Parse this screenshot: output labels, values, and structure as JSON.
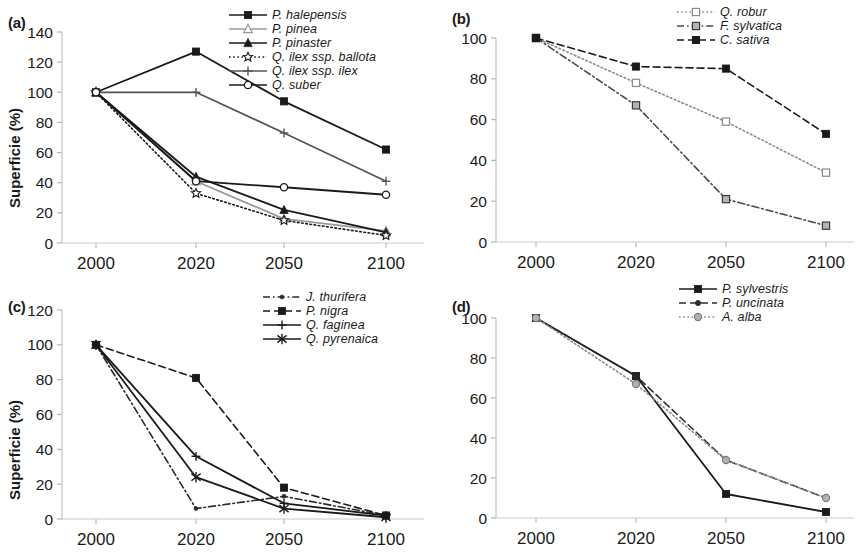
{
  "figure": {
    "x_categories": [
      "2000",
      "2020",
      "2050",
      "2100"
    ],
    "y_axis_title": "Superficie (%)"
  },
  "panels": {
    "a": {
      "label": "(a)",
      "y_ticks": [
        "0",
        "20",
        "40",
        "60",
        "80",
        "100",
        "120",
        "140"
      ],
      "y_title": "Superficie (%)"
    },
    "b": {
      "label": "(b)",
      "y_ticks": [
        "0",
        "20",
        "40",
        "60",
        "80",
        "100"
      ],
      "y_title": ""
    },
    "c": {
      "label": "(c)",
      "y_ticks": [
        "0",
        "20",
        "40",
        "60",
        "80",
        "100",
        "120"
      ],
      "y_title": "Superficie (%)"
    },
    "d": {
      "label": "(d)",
      "y_ticks": [
        "0",
        "20",
        "40",
        "60",
        "80",
        "100"
      ],
      "y_title": ""
    }
  },
  "legend_labels": {
    "a": [
      "P. halepensis",
      "P. pinea",
      "P. pinaster",
      "Q. ilex ssp. ballota",
      "Q. ilex ssp. ilex",
      "Q. suber"
    ],
    "b": [
      "Q. robur",
      "F. sylvatica",
      "C. sativa"
    ],
    "c": [
      "J. thurifera",
      "P. nigra",
      "Q. faginea",
      "Q. pyrenaica"
    ],
    "d": [
      "P. sylvestris",
      "P. uncinata",
      "A. alba"
    ]
  },
  "chart_data": [
    {
      "type": "line",
      "panel": "a",
      "title": "(a)",
      "xlabel": "",
      "ylabel": "Superficie (%)",
      "x": [
        "2000",
        "2020",
        "2050",
        "2100"
      ],
      "ylim": [
        0,
        140
      ],
      "ytick_step": 20,
      "grid": false,
      "legend_position": "top-right",
      "series": [
        {
          "name": "P. halepensis",
          "values": [
            100,
            127,
            94,
            62
          ],
          "marker": "filled-square",
          "dash": "solid",
          "color": "#1a1a1a"
        },
        {
          "name": "P. pinea",
          "values": [
            100,
            41,
            16,
            8
          ],
          "marker": "open-triangle",
          "dash": "solid",
          "color": "#9a9a9a"
        },
        {
          "name": "P. pinaster",
          "values": [
            100,
            44,
            22,
            7
          ],
          "marker": "filled-triangle",
          "dash": "solid",
          "color": "#1a1a1a"
        },
        {
          "name": "Q. ilex ssp. ballota",
          "values": [
            100,
            33,
            15,
            5
          ],
          "marker": "open-star",
          "dash": "dotted",
          "color": "#1a1a1a"
        },
        {
          "name": "Q. ilex ssp. ilex",
          "values": [
            100,
            100,
            73,
            41
          ],
          "marker": "plus",
          "dash": "solid",
          "color": "#555555"
        },
        {
          "name": "Q. suber",
          "values": [
            100,
            41,
            37,
            32
          ],
          "marker": "open-circle",
          "dash": "solid",
          "color": "#1a1a1a"
        }
      ]
    },
    {
      "type": "line",
      "panel": "b",
      "title": "(b)",
      "xlabel": "",
      "ylabel": "",
      "x": [
        "2000",
        "2020",
        "2050",
        "2100"
      ],
      "ylim": [
        0,
        100
      ],
      "ytick_step": 20,
      "grid": false,
      "legend_position": "top-right",
      "series": [
        {
          "name": "Q. robur",
          "values": [
            100,
            78,
            59,
            34
          ],
          "marker": "open-square",
          "dash": "dotted",
          "color": "#8a8a8a"
        },
        {
          "name": "F. sylvatica",
          "values": [
            100,
            67,
            21,
            8
          ],
          "marker": "shaded-square",
          "dash": "dashdot",
          "color": "#4a4a4a"
        },
        {
          "name": "C. sativa",
          "values": [
            100,
            86,
            85,
            53
          ],
          "marker": "filled-square",
          "dash": "dashed",
          "color": "#1a1a1a"
        }
      ]
    },
    {
      "type": "line",
      "panel": "c",
      "title": "(c)",
      "xlabel": "",
      "ylabel": "Superficie (%)",
      "x": [
        "2000",
        "2020",
        "2050",
        "2100"
      ],
      "ylim": [
        0,
        120
      ],
      "ytick_step": 20,
      "grid": false,
      "legend_position": "top-right",
      "series": [
        {
          "name": "J. thurifera",
          "values": [
            100,
            6,
            13,
            2
          ],
          "marker": "dot",
          "dash": "dashdot",
          "color": "#2a2a2a"
        },
        {
          "name": "P. nigra",
          "values": [
            100,
            81,
            18,
            2
          ],
          "marker": "filled-square",
          "dash": "dashed",
          "color": "#1a1a1a"
        },
        {
          "name": "Q. faginea",
          "values": [
            100,
            36,
            9,
            2
          ],
          "marker": "plus",
          "dash": "solid",
          "color": "#1a1a1a"
        },
        {
          "name": "Q. pyrenaica",
          "values": [
            100,
            24,
            6,
            1
          ],
          "marker": "cross-bar",
          "dash": "solid",
          "color": "#1a1a1a"
        }
      ]
    },
    {
      "type": "line",
      "panel": "d",
      "title": "(d)",
      "xlabel": "",
      "ylabel": "",
      "x": [
        "2000",
        "2020",
        "2050",
        "2100"
      ],
      "ylim": [
        0,
        100
      ],
      "ytick_step": 20,
      "grid": false,
      "legend_position": "top-right",
      "series": [
        {
          "name": "P. sylvestris",
          "values": [
            100,
            71,
            12,
            3
          ],
          "marker": "filled-square",
          "dash": "solid",
          "color": "#1a1a1a"
        },
        {
          "name": "P. uncinata",
          "values": [
            100,
            71,
            29,
            10
          ],
          "marker": "filled-dot",
          "dash": "dashed",
          "color": "#2a2a2a"
        },
        {
          "name": "A. alba",
          "values": [
            100,
            67,
            29,
            10
          ],
          "marker": "shaded-circle",
          "dash": "dotted",
          "color": "#8a8a8a"
        }
      ]
    }
  ]
}
